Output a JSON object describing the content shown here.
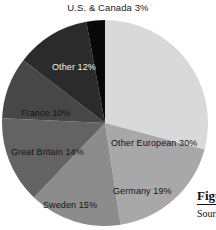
{
  "figure": {
    "top_callout": "U.S. & Canada 3%",
    "caption_title": "Figure",
    "caption_source": "Source:"
  },
  "chart_data": {
    "type": "pie",
    "title": "",
    "subtitle": "",
    "xlabel": "",
    "ylabel": "",
    "legend_position": "none",
    "grid": false,
    "units": "percent",
    "start_angle_deg": 0,
    "direction": "clockwise",
    "center_px": [
      105,
      123
    ],
    "radius_px": 103,
    "categories": [
      "Other European",
      "Germany",
      "Sweden",
      "Great Britain",
      "France",
      "Other",
      "U.S. & Canada"
    ],
    "values": [
      30,
      19,
      15,
      14,
      10,
      12,
      3
    ],
    "total": 103,
    "slices": [
      {
        "name": "Other European",
        "value": 30,
        "label": "Other European 30%",
        "color": "#d9d9d9",
        "text_color": "#141414",
        "label_placement": "inside"
      },
      {
        "name": "Germany",
        "value": 19,
        "label": "Germany 19%",
        "color": "#a8a8a8",
        "text_color": "#141414",
        "label_placement": "inside"
      },
      {
        "name": "Sweden",
        "value": 15,
        "label": "Sweden 15%",
        "color": "#8c8c8c",
        "text_color": "#141414",
        "label_placement": "inside"
      },
      {
        "name": "Great Britain",
        "value": 14,
        "label": "Great Britain 14%",
        "color": "#636363",
        "text_color": "#141414",
        "label_placement": "inside"
      },
      {
        "name": "France",
        "value": 10,
        "label": "France 10%",
        "color": "#474747",
        "text_color": "#141414",
        "label_placement": "inside"
      },
      {
        "name": "Other",
        "value": 12,
        "label": "Other 12%",
        "color": "#2b2b2b",
        "text_color": "#f2f2f2",
        "label_placement": "inside"
      },
      {
        "name": "U.S. & Canada",
        "value": 3,
        "label": "U.S. & Canada 3%",
        "color": "#080808",
        "text_color": "#141414",
        "label_placement": "outside-top"
      }
    ]
  }
}
